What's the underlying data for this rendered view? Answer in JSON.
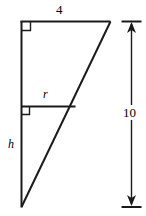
{
  "figure": {
    "type": "geometry-diagram",
    "background_color": "#ffffff",
    "stroke_color": "#1a1a1a",
    "labels": {
      "top_side": "4",
      "inner_segment": "r",
      "left_side": "h",
      "dimension": "10"
    },
    "geometry": {
      "apex_top_left": [
        21,
        21
      ],
      "apex_top_right": [
        110,
        21
      ],
      "apex_bottom_left": [
        21,
        207
      ],
      "inner_segment_left": [
        21,
        106
      ],
      "inner_segment_right": [
        75,
        106
      ],
      "right_angle_markers": [
        {
          "name": "top-left-corner",
          "x": 21,
          "y": 21
        },
        {
          "name": "inner-segment-corner",
          "x": 21,
          "y": 106
        }
      ],
      "dimension_line": {
        "x": 131,
        "top_y": 21,
        "bottom_y": 207,
        "tick_left": 122,
        "tick_right": 141
      }
    }
  }
}
